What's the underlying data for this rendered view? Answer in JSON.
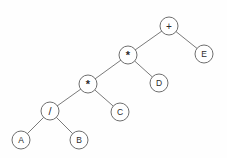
{
  "diagram": {
    "type": "binary-expression-tree",
    "background_color": "#fefefe",
    "node_fill_color": "#ffffff",
    "node_stroke_color": "#6e6e6e",
    "edge_color": "#7a7a7a",
    "label_color": "#2b2b2b",
    "node_radius": 9,
    "expression": "A / B * C * D + E",
    "nodes": [
      {
        "id": "n0",
        "label": "+",
        "kind": "operator",
        "x": 169,
        "y": 26,
        "label_class": "op-plus"
      },
      {
        "id": "n1",
        "label": "*",
        "kind": "operator",
        "x": 128,
        "y": 55,
        "label_class": "op-star"
      },
      {
        "id": "n2",
        "label": "E",
        "kind": "operand",
        "x": 204,
        "y": 54,
        "label_class": ""
      },
      {
        "id": "n3",
        "label": "*",
        "kind": "operator",
        "x": 88,
        "y": 84,
        "label_class": "op-star"
      },
      {
        "id": "n4",
        "label": "D",
        "kind": "operand",
        "x": 159,
        "y": 83,
        "label_class": ""
      },
      {
        "id": "n5",
        "label": "/",
        "kind": "operator",
        "x": 50,
        "y": 111,
        "label_class": "op-slash"
      },
      {
        "id": "n6",
        "label": "C",
        "kind": "operand",
        "x": 120,
        "y": 112,
        "label_class": ""
      },
      {
        "id": "n7",
        "label": "A",
        "kind": "operand",
        "x": 21,
        "y": 140,
        "label_class": ""
      },
      {
        "id": "n8",
        "label": "B",
        "kind": "operand",
        "x": 79,
        "y": 140,
        "label_class": ""
      }
    ],
    "edges": [
      {
        "from": "n0",
        "to": "n1",
        "side": "left"
      },
      {
        "from": "n0",
        "to": "n2",
        "side": "right"
      },
      {
        "from": "n1",
        "to": "n3",
        "side": "left"
      },
      {
        "from": "n1",
        "to": "n4",
        "side": "right"
      },
      {
        "from": "n3",
        "to": "n5",
        "side": "left"
      },
      {
        "from": "n3",
        "to": "n6",
        "side": "right"
      },
      {
        "from": "n5",
        "to": "n7",
        "side": "left"
      },
      {
        "from": "n5",
        "to": "n8",
        "side": "right"
      }
    ]
  }
}
